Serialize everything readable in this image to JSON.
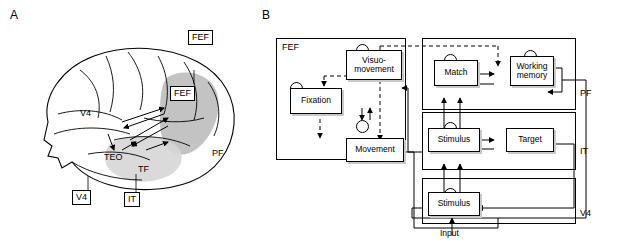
{
  "panels": {
    "a_label": "A",
    "b_label": "B"
  },
  "brain": {
    "labels": [
      {
        "id": "fef-box",
        "text": "FEF",
        "boxed": true
      },
      {
        "id": "fef-plain",
        "text": "FEF",
        "boxed": true
      },
      {
        "id": "v4-plain",
        "text": "V4",
        "boxed": false
      },
      {
        "id": "teo",
        "text": "TEO",
        "boxed": false
      },
      {
        "id": "tf",
        "text": "TF",
        "boxed": false
      },
      {
        "id": "pf",
        "text": "PF",
        "boxed": false
      },
      {
        "id": "v4-box",
        "text": "V4",
        "boxed": true
      },
      {
        "id": "it-box",
        "text": "IT",
        "boxed": true
      }
    ]
  },
  "diagram": {
    "groups": [
      {
        "id": "fef-group",
        "label": "FEF"
      },
      {
        "id": "pf-group",
        "label": "PF"
      },
      {
        "id": "it-group",
        "label": "IT"
      },
      {
        "id": "v4-group",
        "label": "V4"
      }
    ],
    "nodes": [
      {
        "id": "fixation",
        "text": "Fixation"
      },
      {
        "id": "visuo-movement",
        "text": "Visuo-\nmovement"
      },
      {
        "id": "movement",
        "text": "Movement"
      },
      {
        "id": "match",
        "text": "Match"
      },
      {
        "id": "working-memory",
        "text": "Working\nmemory"
      },
      {
        "id": "stimulus-it",
        "text": "Stimulus"
      },
      {
        "id": "target",
        "text": "Target"
      },
      {
        "id": "stimulus-v4",
        "text": "Stimulus"
      }
    ],
    "input_label": "Input"
  }
}
